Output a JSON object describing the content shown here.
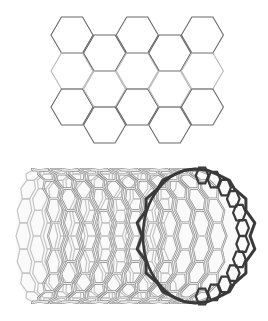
{
  "figure": {
    "background": "#ffffff"
  },
  "sheet": {
    "label": "graphene-sheet",
    "hex_side": 21,
    "col_spacing": 32.6,
    "row_height": 36,
    "origin_left_x": 51,
    "origin_top_y": 17,
    "columns": 5,
    "rows_per_column": 3,
    "odd_column_offset_y": 18,
    "dark_stroke": "#6a6a6a",
    "light_stroke": "#b8b8b8",
    "stroke_width": 1.1
  },
  "nanotube": {
    "label": "carbon-nanotube",
    "left_x": 22,
    "rim_cx": 196,
    "cy": 236,
    "ry": 67,
    "rim_rx": 55,
    "back_rx": 16,
    "rings": 11,
    "hex_around": 16,
    "tube_stroke": "#8c8c8c",
    "tube_fill_light": "#e6e6e6",
    "rim_stroke": "#3a3a3a"
  }
}
